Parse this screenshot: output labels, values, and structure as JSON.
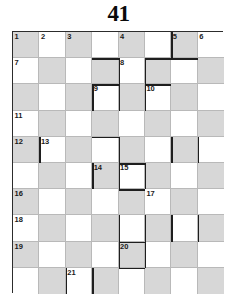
{
  "puzzle": {
    "title": "41",
    "type": "crossword-grid",
    "columns": 8,
    "rows": 10,
    "cell_size": 26.3,
    "shade_color": "#d7d7d7",
    "light_color": "#ffffff",
    "grid_line_color": "#b9b9b9",
    "border_color": "#2c2c2c",
    "shading_rule": "checkerboard: shaded when (row + col) is even, 0-indexed",
    "numbers": [
      {
        "n": "1",
        "row": 0,
        "col": 0
      },
      {
        "n": "2",
        "row": 0,
        "col": 1
      },
      {
        "n": "3",
        "row": 0,
        "col": 2
      },
      {
        "n": "4",
        "row": 0,
        "col": 4
      },
      {
        "n": "5",
        "row": 0,
        "col": 6
      },
      {
        "n": "6",
        "row": 0,
        "col": 7
      },
      {
        "n": "7",
        "row": 1,
        "col": 0
      },
      {
        "n": "8",
        "row": 1,
        "col": 4
      },
      {
        "n": "9",
        "row": 2,
        "col": 3
      },
      {
        "n": "10",
        "row": 2,
        "col": 5
      },
      {
        "n": "11",
        "row": 3,
        "col": 0
      },
      {
        "n": "12",
        "row": 4,
        "col": 0
      },
      {
        "n": "13",
        "row": 4,
        "col": 1
      },
      {
        "n": "14",
        "row": 5,
        "col": 3
      },
      {
        "n": "15",
        "row": 5,
        "col": 4
      },
      {
        "n": "16",
        "row": 6,
        "col": 0
      },
      {
        "n": "17",
        "row": 6,
        "col": 5
      },
      {
        "n": "18",
        "row": 7,
        "col": 0
      },
      {
        "n": "19",
        "row": 8,
        "col": 0
      },
      {
        "n": "20",
        "row": 8,
        "col": 4
      },
      {
        "n": "21",
        "row": 9,
        "col": 2
      }
    ],
    "thick_edges": [
      {
        "orient": "h",
        "row": 1,
        "col": 3
      },
      {
        "orient": "h",
        "row": 1,
        "col": 5
      },
      {
        "orient": "h",
        "row": 1,
        "col": 6
      },
      {
        "orient": "h",
        "row": 2,
        "col": 3
      },
      {
        "orient": "h",
        "row": 2,
        "col": 5
      },
      {
        "orient": "h",
        "row": 4,
        "col": 3
      },
      {
        "orient": "h",
        "row": 5,
        "col": 4
      },
      {
        "orient": "h",
        "row": 6,
        "col": 4
      },
      {
        "orient": "h",
        "row": 8,
        "col": 4
      },
      {
        "orient": "h",
        "row": 9,
        "col": 4
      },
      {
        "orient": "v",
        "row": 0,
        "col": 6
      },
      {
        "orient": "v",
        "row": 1,
        "col": 4
      },
      {
        "orient": "v",
        "row": 1,
        "col": 5
      },
      {
        "orient": "v",
        "row": 2,
        "col": 3
      },
      {
        "orient": "v",
        "row": 2,
        "col": 4
      },
      {
        "orient": "v",
        "row": 2,
        "col": 5
      },
      {
        "orient": "v",
        "row": 4,
        "col": 1
      },
      {
        "orient": "v",
        "row": 4,
        "col": 4
      },
      {
        "orient": "v",
        "row": 4,
        "col": 6
      },
      {
        "orient": "v",
        "row": 4,
        "col": 7
      },
      {
        "orient": "v",
        "row": 5,
        "col": 3
      },
      {
        "orient": "v",
        "row": 5,
        "col": 4
      },
      {
        "orient": "v",
        "row": 5,
        "col": 5
      },
      {
        "orient": "v",
        "row": 7,
        "col": 4
      },
      {
        "orient": "v",
        "row": 7,
        "col": 5
      },
      {
        "orient": "v",
        "row": 7,
        "col": 6
      },
      {
        "orient": "v",
        "row": 7,
        "col": 7
      },
      {
        "orient": "v",
        "row": 8,
        "col": 4
      },
      {
        "orient": "v",
        "row": 8,
        "col": 5
      },
      {
        "orient": "v",
        "row": 9,
        "col": 2
      },
      {
        "orient": "v",
        "row": 9,
        "col": 3
      }
    ]
  }
}
